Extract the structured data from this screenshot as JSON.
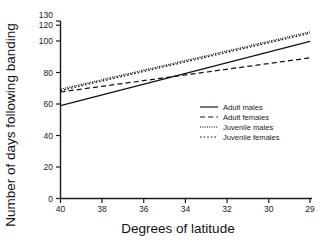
{
  "chart_data": {
    "type": "line",
    "title": "",
    "xlabel": "Degrees of latitude",
    "ylabel": "Number of days following banding",
    "xlim": [
      40,
      29
    ],
    "ylim": [
      0,
      130
    ],
    "x_ticks": [
      40,
      38,
      36,
      34,
      32,
      30,
      29
    ],
    "y_ticks": [
      0,
      20,
      40,
      60,
      80,
      100,
      120,
      130
    ],
    "x_axis_inverted": true,
    "grid": false,
    "legend_position": "center-right",
    "x": [
      40,
      29
    ],
    "series": [
      {
        "name": "Adult males",
        "style": "solid",
        "values": [
          68,
          115
        ]
      },
      {
        "name": "Adult females",
        "style": "dashed",
        "values": [
          78,
          103
        ]
      },
      {
        "name": "Juvenile males",
        "style": "dotted-fine",
        "values": [
          80,
          122
        ]
      },
      {
        "name": "Juvenile females",
        "style": "dotted-coarse",
        "values": [
          79,
          121
        ]
      }
    ]
  },
  "axes": {
    "x_title": "Degrees of latitude",
    "y_title": "Number of days following banding",
    "x_tick_labels": [
      "40",
      "38",
      "36",
      "34",
      "32",
      "30",
      "29"
    ],
    "y_tick_labels": [
      "0",
      "20",
      "40",
      "60",
      "80",
      "100",
      "120",
      "130"
    ]
  },
  "legend": {
    "entries": [
      {
        "label": "Adult males"
      },
      {
        "label": "Adult females"
      },
      {
        "label": "Juvenile males"
      },
      {
        "label": "Juvenile females"
      }
    ]
  },
  "colors": {
    "ink": "#111111",
    "background": "#ffffff"
  }
}
